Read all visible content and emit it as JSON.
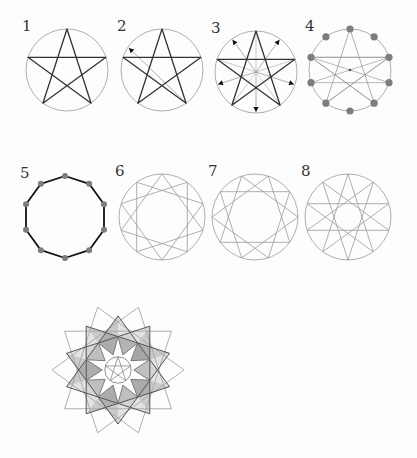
{
  "colors": {
    "circle": "#a6a6a6",
    "thin_line": "#9a9a9a",
    "thick_line": "#333333",
    "dot": "#7d7d7d",
    "shade_dark": "#8c8c8c",
    "shade_light": "#c4c4c4",
    "bold": "#111111"
  },
  "panels": [
    {
      "label": "1",
      "cx": 67,
      "cy": 70,
      "r": 41,
      "type": "pentagram"
    },
    {
      "label": "2",
      "cx": 162,
      "cy": 70,
      "r": 41,
      "type": "pentagram-one-arrow"
    },
    {
      "label": "3",
      "cx": 256,
      "cy": 72,
      "r": 41,
      "type": "pentagram-five-arrows"
    },
    {
      "label": "4",
      "cx": 350,
      "cy": 70,
      "r": 41,
      "type": "ten-points-with-chords"
    },
    {
      "label": "5",
      "cx": 65,
      "cy": 217,
      "r": 41,
      "type": "decagon"
    },
    {
      "label": "6",
      "cx": 162,
      "cy": 217,
      "r": 43,
      "type": "decagram-10-3-light"
    },
    {
      "label": "7",
      "cx": 255,
      "cy": 217,
      "r": 43,
      "type": "decagram-10-3"
    },
    {
      "label": "8",
      "cx": 348,
      "cy": 217,
      "r": 43,
      "type": "decagram-10-4"
    }
  ],
  "bottom": {
    "rosette": {
      "cx": 118,
      "cy": 370,
      "r": 66
    },
    "vesica_hex": {
      "left_cx": 262,
      "right_cx": 318,
      "cy": 366,
      "r": 55
    }
  }
}
